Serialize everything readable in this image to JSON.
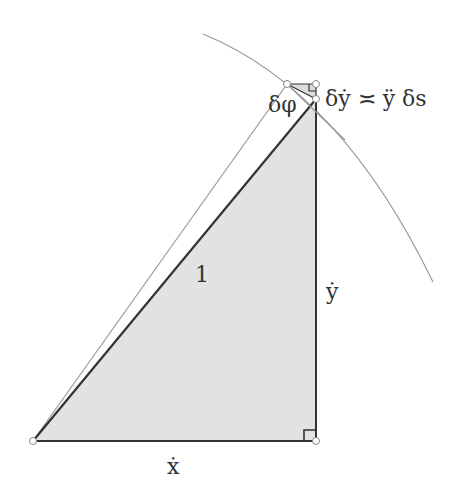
{
  "labels": {
    "hyp": "1",
    "xdot": "ẋ",
    "ydot": "ẏ",
    "dphi": "δφ",
    "relation": "δẏ ≍ ÿ δs"
  },
  "colors": {
    "fill": "#e6e6e6",
    "edge": "#333333",
    "thin": "#999999"
  }
}
